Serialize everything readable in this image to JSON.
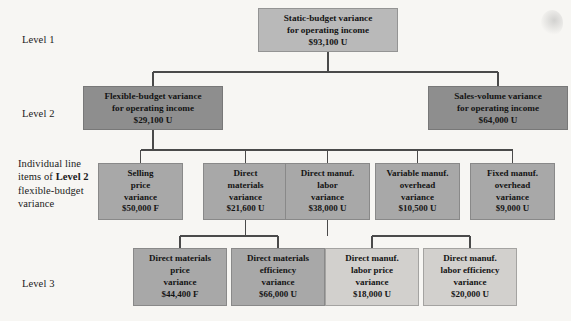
{
  "figure": {
    "row_labels": {
      "level1": "Level 1",
      "level2": "Level 2",
      "level3": "Level 3",
      "line_items_prefix": "Individual line items of ",
      "line_items_bold": "Level 2",
      "line_items_suffix": " flexible-budget variance"
    },
    "colors": {
      "background": "#f7f6f3",
      "level1_box": "#b9b9b9",
      "level2_box": "#8e8e8e",
      "level3_box": "#a8a8a8",
      "level4_box": "#d2d0cd",
      "connector": "#4a4a4a",
      "text": "#141414"
    }
  },
  "nodes": {
    "static_budget": {
      "line1": "Static-budget variance",
      "line2": "for operating income",
      "amount": "$93,100 U"
    },
    "flexible_budget": {
      "line1": "Flexible-budget variance",
      "line2": "for operating income",
      "amount": "$29,100 U"
    },
    "sales_volume": {
      "line1": "Sales-volume variance",
      "line2": "for operating income",
      "amount": "$64,000 U"
    },
    "selling_price": {
      "line1": "Selling",
      "line2": "price",
      "line3": "variance",
      "amount": "$50,000 F"
    },
    "direct_materials": {
      "line1": "Direct",
      "line2": "materials",
      "line3": "variance",
      "amount": "$21,600 U"
    },
    "direct_manuf_labor": {
      "line1": "Direct manuf.",
      "line2": "labor",
      "line3": "variance",
      "amount": "$38,000 U"
    },
    "variable_manuf_overhead": {
      "line1": "Variable manuf.",
      "line2": "overhead",
      "line3": "variance",
      "amount": "$10,500 U"
    },
    "fixed_manuf_overhead": {
      "line1": "Fixed manuf.",
      "line2": "overhead",
      "line3": "variance",
      "amount": "$9,000 U"
    },
    "dm_price": {
      "line1": "Direct materials",
      "line2": "price",
      "line3": "variance",
      "amount": "$44,400 F"
    },
    "dm_efficiency": {
      "line1": "Direct materials",
      "line2": "efficiency",
      "line3": "variance",
      "amount": "$66,000 U"
    },
    "dml_price": {
      "line1": "Direct manuf.",
      "line2": "labor price",
      "line3": "variance",
      "amount": "$18,000 U"
    },
    "dml_efficiency": {
      "line1": "Direct manuf.",
      "line2": "labor efficiency",
      "line3": "variance",
      "amount": "$20,000 U"
    }
  }
}
